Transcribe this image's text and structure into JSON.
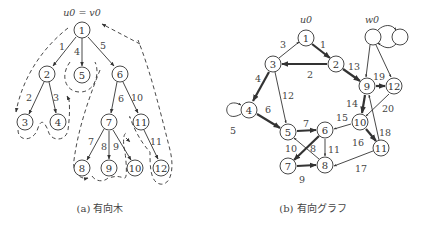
{
  "tree": {
    "root_label": "u0 = v0",
    "caption": "(a) 有向木",
    "nodes": [
      {
        "id": "1",
        "x": 82,
        "y": 30
      },
      {
        "id": "2",
        "x": 47,
        "y": 74
      },
      {
        "id": "5",
        "x": 82,
        "y": 75
      },
      {
        "id": "6",
        "x": 120,
        "y": 74
      },
      {
        "id": "3",
        "x": 25,
        "y": 122
      },
      {
        "id": "4",
        "x": 58,
        "y": 122
      },
      {
        "id": "7",
        "x": 109,
        "y": 122
      },
      {
        "id": "11",
        "x": 141,
        "y": 122
      },
      {
        "id": "8",
        "x": 82,
        "y": 168
      },
      {
        "id": "9",
        "x": 109,
        "y": 168
      },
      {
        "id": "10",
        "x": 135,
        "y": 168
      },
      {
        "id": "12",
        "x": 161,
        "y": 168
      }
    ],
    "edges": [
      {
        "from": "1",
        "to": "2",
        "label": "1"
      },
      {
        "from": "1",
        "to": "5",
        "label": "4"
      },
      {
        "from": "1",
        "to": "6",
        "label": "5"
      },
      {
        "from": "2",
        "to": "3",
        "label": "2"
      },
      {
        "from": "2",
        "to": "4",
        "label": "3"
      },
      {
        "from": "6",
        "to": "7",
        "label": "6"
      },
      {
        "from": "6",
        "to": "11",
        "label": "10"
      },
      {
        "from": "7",
        "to": "8",
        "label": "7"
      },
      {
        "from": "7",
        "to": "9",
        "label": "8"
      },
      {
        "from": "7",
        "to": "10",
        "label": "9"
      },
      {
        "from": "11",
        "to": "12",
        "label": "11"
      }
    ]
  },
  "graph": {
    "u0_label": "u0",
    "w0_label": "w0",
    "caption": "(b) 有向グラフ",
    "nodes": [
      {
        "id": "1",
        "x": 306,
        "y": 38
      },
      {
        "id": "2",
        "x": 336,
        "y": 64
      },
      {
        "id": "3",
        "x": 273,
        "y": 64
      },
      {
        "id": "4",
        "x": 249,
        "y": 110
      },
      {
        "id": "5",
        "x": 288,
        "y": 132
      },
      {
        "id": "6",
        "x": 325,
        "y": 130
      },
      {
        "id": "7",
        "x": 288,
        "y": 166
      },
      {
        "id": "8",
        "x": 325,
        "y": 165
      },
      {
        "id": "9",
        "x": 367,
        "y": 86
      },
      {
        "id": "12",
        "x": 394,
        "y": 86
      },
      {
        "id": "10",
        "x": 360,
        "y": 122
      },
      {
        "id": "11",
        "x": 381,
        "y": 148
      }
    ],
    "edges": [
      {
        "from": "1",
        "to": "2",
        "label": "1",
        "thick": true
      },
      {
        "from": "2",
        "to": "3",
        "label": "2",
        "thick": true
      },
      {
        "from": "3",
        "to": "1",
        "label": "3",
        "thick": false
      },
      {
        "from": "3",
        "to": "4",
        "label": "4",
        "thick": true
      },
      {
        "from": "4",
        "to": "4",
        "label": "5",
        "thick": false
      },
      {
        "from": "4",
        "to": "5",
        "label": "6",
        "thick": true
      },
      {
        "from": "5",
        "to": "6",
        "label": "7",
        "thick": true
      },
      {
        "from": "6",
        "to": "7",
        "label": "8",
        "thick": true
      },
      {
        "from": "7",
        "to": "8",
        "label": "9",
        "thick": true
      },
      {
        "from": "8",
        "to": "5",
        "label": "10",
        "thick": false
      },
      {
        "from": "6",
        "to": "8",
        "label": "11",
        "thick": false
      },
      {
        "from": "3",
        "to": "5",
        "label": "12",
        "thick": false
      },
      {
        "from": "2",
        "to": "9",
        "label": "13",
        "thick": true
      },
      {
        "from": "9",
        "to": "10",
        "label": "14",
        "thick": true
      },
      {
        "from": "10",
        "to": "6",
        "label": "15",
        "thick": false
      },
      {
        "from": "10",
        "to": "11",
        "label": "16",
        "thick": true
      },
      {
        "from": "11",
        "to": "8",
        "label": "17",
        "thick": false
      },
      {
        "from": "11",
        "to": "9",
        "label": "18",
        "thick": false
      },
      {
        "from": "9",
        "to": "12",
        "label": "19",
        "thick": true
      },
      {
        "from": "12",
        "to": "10",
        "label": "20",
        "thick": false
      }
    ]
  }
}
